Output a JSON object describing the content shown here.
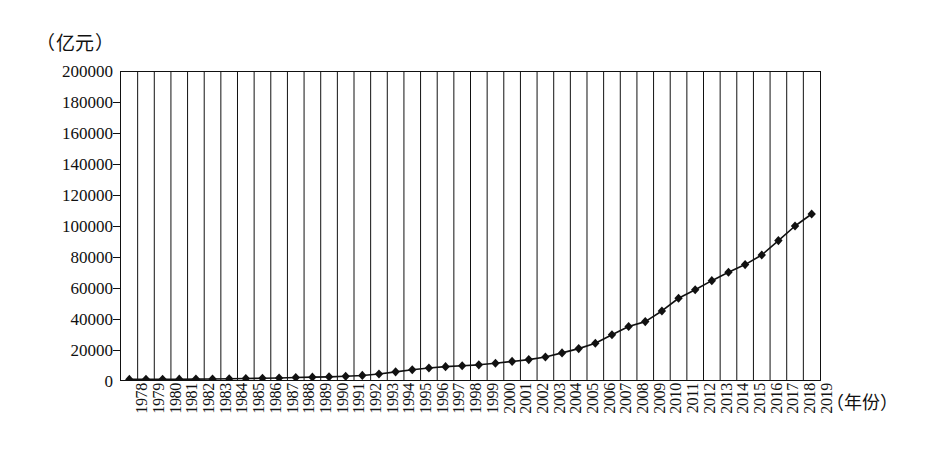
{
  "figure": {
    "background_color": "#ffffff",
    "line_color": "#111111",
    "marker_shape": "diamond"
  },
  "axes": {
    "y_unit_label": "（亿元）",
    "x_axis_title": "（年份）",
    "y_tick_labels": [
      "200000",
      "180000",
      "160000",
      "140000",
      "120000",
      "100000",
      "80000",
      "60000",
      "40000",
      "20000",
      "0"
    ],
    "y_min": 0,
    "y_max": 200000,
    "y_step": 20000
  },
  "chart_data": {
    "type": "line",
    "title": "",
    "xlabel": "（年份）",
    "ylabel": "（亿元）",
    "ylim": [
      0,
      200000
    ],
    "grid": true,
    "grid_orientation": "vertical",
    "legend": "none",
    "marker": "diamond",
    "categories": [
      "1978",
      "1979",
      "1980",
      "1981",
      "1982",
      "1983",
      "1984",
      "1985",
      "1986",
      "1987",
      "1988",
      "1989",
      "1990",
      "1991",
      "1992",
      "1993",
      "1994",
      "1995",
      "1996",
      "1997",
      "1998",
      "1999",
      "2000",
      "2001",
      "2002",
      "2003",
      "2004",
      "2005",
      "2006",
      "2007",
      "2008",
      "2009",
      "2010",
      "2011",
      "2012",
      "2013",
      "2014",
      "2015",
      "2016",
      "2017",
      "2018",
      "2019"
    ],
    "values": [
      3679,
      4101,
      4546,
      4892,
      5323,
      5963,
      7208,
      9016,
      10275,
      12059,
      15043,
      17001,
      18872,
      22006,
      27195,
      35674,
      48638,
      61340,
      71814,
      79715,
      85196,
      90564,
      100280,
      110863,
      121717,
      137422,
      161840,
      187319,
      219439,
      270092,
      319245,
      348518,
      412119,
      487940,
      538580,
      592963,
      643563,
      688858,
      746395,
      832036,
      919281,
      990865
    ],
    "values_plotted_scaled": [
      400,
      450,
      500,
      530,
      580,
      650,
      780,
      980,
      1120,
      1310,
      1640,
      1850,
      2050,
      2390,
      2960,
      3880,
      5290,
      6670,
      7810,
      8670,
      9270,
      9850,
      10900,
      12060,
      13240,
      14950,
      17600,
      20380,
      23870,
      29380,
      34730,
      37910,
      44830,
      53080,
      58580,
      64500,
      70000,
      74940,
      81190,
      90510,
      100000,
      107790
    ],
    "series": [
      {
        "name": "国内生产总值",
        "values": [
          3679,
          4101,
          4546,
          4892,
          5323,
          5963,
          7208,
          9016,
          10275,
          12059,
          15043,
          17001,
          18872,
          22006,
          27195,
          35674,
          48638,
          61340,
          71814,
          79715,
          85196,
          90564,
          100280,
          110863,
          121717,
          137422,
          161840,
          187319,
          219439,
          270092,
          319245,
          348518,
          412119,
          487940,
          538580,
          592963,
          643563,
          688858,
          746395,
          832036,
          919281,
          990865
        ]
      }
    ]
  }
}
